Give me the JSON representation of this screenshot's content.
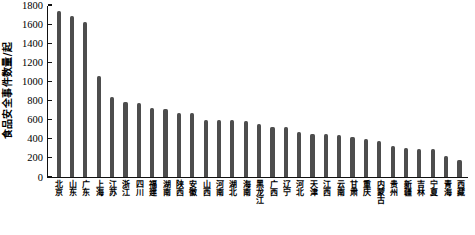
{
  "chart_data": {
    "type": "bar",
    "title": "",
    "xlabel": "",
    "ylabel": "食品安全事件数量/起",
    "ylim": [
      0,
      1800
    ],
    "ytick_step": 200,
    "yticks": [
      0,
      200,
      400,
      600,
      800,
      1000,
      1200,
      1400,
      1600,
      1800
    ],
    "grid": false,
    "legend": "none",
    "bar_color": "#4d4d4d",
    "categories": [
      "北京",
      "山东",
      "广东",
      "上海",
      "江苏",
      "浙江",
      "四川",
      "福建",
      "湖南",
      "陕西",
      "安徽",
      "山西",
      "河南",
      "湖北",
      "海南",
      "黑龙江",
      "广西",
      "辽宁",
      "河北",
      "天津",
      "江西",
      "云南",
      "甘肃",
      "重庆",
      "内蒙古",
      "贵州",
      "新疆",
      "吉林",
      "宁夏",
      "青海",
      "西藏"
    ],
    "values": [
      1740,
      1690,
      1620,
      1060,
      840,
      780,
      775,
      720,
      715,
      670,
      665,
      600,
      600,
      595,
      585,
      560,
      525,
      520,
      475,
      455,
      455,
      440,
      415,
      395,
      375,
      320,
      300,
      295,
      290,
      220,
      175
    ]
  }
}
